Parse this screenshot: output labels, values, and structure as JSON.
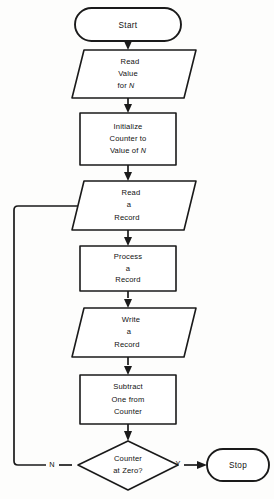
{
  "diagram": {
    "type": "flowchart",
    "nodes": {
      "start": {
        "shape": "terminal",
        "label": "Start"
      },
      "read_value": {
        "shape": "input-output",
        "line1": "Read",
        "line2": "Value",
        "line3_prefix": "for ",
        "line3_var": "N"
      },
      "initialize": {
        "shape": "process",
        "line1": "Initialize",
        "line2": "Counter to",
        "line3_prefix": "Value of ",
        "line3_var": "N"
      },
      "read_record": {
        "shape": "input-output",
        "line1": "Read",
        "line2": "a",
        "line3": "Record"
      },
      "process_record": {
        "shape": "process",
        "line1": "Process",
        "line2": "a",
        "line3": "Record"
      },
      "write_record": {
        "shape": "input-output",
        "line1": "Write",
        "line2": "a",
        "line3": "Record"
      },
      "subtract": {
        "shape": "process",
        "line1": "Subtract",
        "line2": "One from",
        "line3": "Counter"
      },
      "decision": {
        "shape": "decision",
        "line1": "Counter",
        "line2": "at Zero?"
      },
      "stop": {
        "shape": "terminal",
        "label": "Stop"
      }
    },
    "branch_labels": {
      "yes": "Y",
      "no": "N"
    },
    "colors": {
      "stroke": "#1a1a1a",
      "fill": "#ffffff",
      "background": "#fdfdfc",
      "text": "#111111"
    }
  }
}
